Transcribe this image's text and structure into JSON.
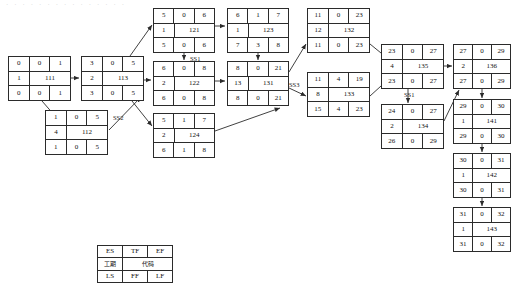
{
  "page": {
    "top_faint_text": "· · · · · · · · · · · · · · ·",
    "ink_color": "#2b2b2b",
    "background": "#ffffff"
  },
  "nodes": [
    {
      "id": "111",
      "code": "111",
      "es": "0",
      "tf": "0",
      "ef": "1",
      "duration": "1",
      "ls": "0",
      "ff": "0",
      "lf": "1",
      "x": 8,
      "y": 56,
      "w": 63,
      "h": 45
    },
    {
      "id": "112",
      "code": "112",
      "es": "1",
      "tf": "0",
      "ef": "5",
      "duration": "4",
      "ls": "1",
      "ff": "0",
      "lf": "5",
      "x": 45,
      "y": 110,
      "w": 63,
      "h": 45
    },
    {
      "id": "113",
      "code": "113",
      "es": "3",
      "tf": "0",
      "ef": "5",
      "duration": "2",
      "ls": "3",
      "ff": "0",
      "lf": "5",
      "x": 81,
      "y": 56,
      "w": 63,
      "h": 45
    },
    {
      "id": "121",
      "code": "121",
      "es": "5",
      "tf": "0",
      "ef": "6",
      "duration": "1",
      "ls": "5",
      "ff": "0",
      "lf": "6",
      "x": 153,
      "y": 8,
      "w": 62,
      "h": 45
    },
    {
      "id": "122",
      "code": "122",
      "es": "6",
      "tf": "0",
      "ef": "8",
      "duration": "2",
      "ls": "6",
      "ff": "0",
      "lf": "8",
      "x": 153,
      "y": 61,
      "w": 62,
      "h": 45
    },
    {
      "id": "124",
      "code": "124",
      "es": "5",
      "tf": "1",
      "ef": "7",
      "duration": "2",
      "ls": "6",
      "ff": "1",
      "lf": "8",
      "x": 153,
      "y": 113,
      "w": 62,
      "h": 45
    },
    {
      "id": "123",
      "code": "123",
      "es": "6",
      "tf": "1",
      "ef": "7",
      "duration": "1",
      "ls": "7",
      "ff": "3",
      "lf": "8",
      "x": 227,
      "y": 8,
      "w": 62,
      "h": 45
    },
    {
      "id": "131",
      "code": "131",
      "es": "8",
      "tf": "0",
      "ef": "21",
      "duration": "13",
      "ls": "8",
      "ff": "0",
      "lf": "21",
      "x": 227,
      "y": 61,
      "w": 62,
      "h": 45
    },
    {
      "id": "132",
      "code": "132",
      "es": "11",
      "tf": "0",
      "ef": "23",
      "duration": "12",
      "ls": "11",
      "ff": "0",
      "lf": "23",
      "x": 307,
      "y": 8,
      "w": 63,
      "h": 45
    },
    {
      "id": "133",
      "code": "133",
      "es": "11",
      "tf": "4",
      "ef": "19",
      "duration": "8",
      "ls": "15",
      "ff": "4",
      "lf": "23",
      "x": 307,
      "y": 72,
      "w": 63,
      "h": 45
    },
    {
      "id": "135",
      "code": "135",
      "es": "23",
      "tf": "0",
      "ef": "27",
      "duration": "4",
      "ls": "23",
      "ff": "0",
      "lf": "27",
      "x": 381,
      "y": 44,
      "w": 63,
      "h": 45
    },
    {
      "id": "134",
      "code": "134",
      "es": "24",
      "tf": "0",
      "ef": "27",
      "duration": "2",
      "ls": "26",
      "ff": "0",
      "lf": "29",
      "x": 381,
      "y": 104,
      "w": 63,
      "h": 45
    },
    {
      "id": "136",
      "code": "136",
      "es": "27",
      "tf": "0",
      "ef": "29",
      "duration": "2",
      "ls": "27",
      "ff": "0",
      "lf": "29",
      "x": 453,
      "y": 44,
      "w": 58,
      "h": 45
    },
    {
      "id": "141",
      "code": "141",
      "es": "29",
      "tf": "0",
      "ef": "30",
      "duration": "1",
      "ls": "29",
      "ff": "0",
      "lf": "30",
      "x": 453,
      "y": 99,
      "w": 58,
      "h": 45
    },
    {
      "id": "142",
      "code": "142",
      "es": "30",
      "tf": "0",
      "ef": "31",
      "duration": "1",
      "ls": "30",
      "ff": "0",
      "lf": "31",
      "x": 453,
      "y": 153,
      "w": 58,
      "h": 45
    },
    {
      "id": "143",
      "code": "143",
      "es": "31",
      "tf": "0",
      "ef": "32",
      "duration": "1",
      "ls": "31",
      "ff": "0",
      "lf": "32",
      "x": 453,
      "y": 207,
      "w": 58,
      "h": 45
    }
  ],
  "lag_labels": [
    {
      "id": "ss2",
      "text": "SS2",
      "x": 113,
      "y": 114
    },
    {
      "id": "ss1-a",
      "text": "SS1",
      "x": 190,
      "y": 55
    },
    {
      "id": "ss3",
      "text": "SS3",
      "x": 289,
      "y": 81
    },
    {
      "id": "ss1-b",
      "text": "SS1",
      "x": 404,
      "y": 91
    }
  ],
  "legend": {
    "x": 97,
    "y": 245,
    "w": 76,
    "h": 38,
    "row_top": {
      "es": "ES",
      "tf": "TF",
      "ef": "EF"
    },
    "row_mid": {
      "duration": "工期",
      "code": "代码"
    },
    "row_bottom": {
      "ls": "LS",
      "ff": "FF",
      "lf": "LF"
    }
  }
}
